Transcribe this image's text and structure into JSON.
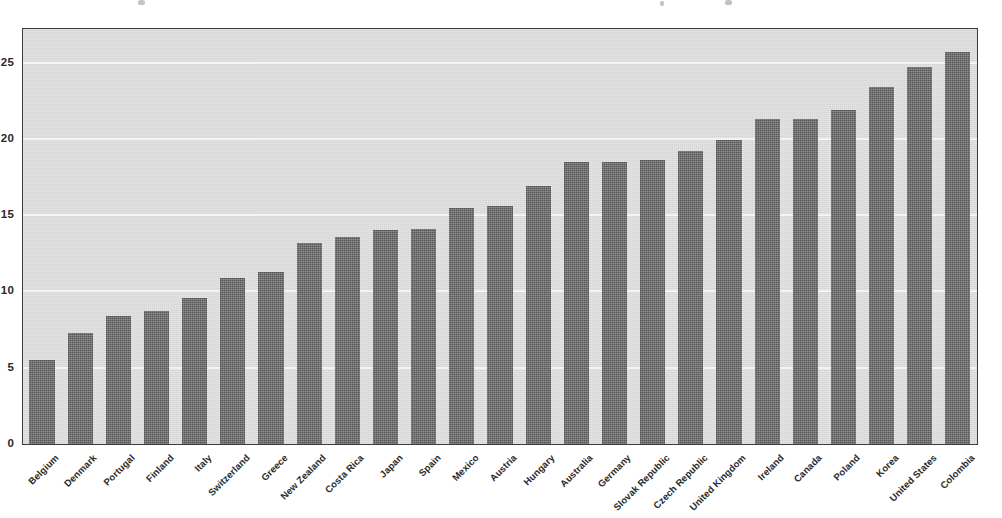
{
  "figure": {
    "ghost_title": "",
    "background_color": "#ffffff",
    "plot_background_color": "#d7d7d7",
    "bar_color": "#565656",
    "gridline_color": "#f2f2f2",
    "frame_color": "#3b3b3b"
  },
  "chart_data": {
    "type": "bar",
    "title": "",
    "xlabel": "",
    "ylabel": "",
    "ylim": [
      0,
      27.2
    ],
    "yticks": [
      0,
      5,
      10,
      15,
      20,
      25
    ],
    "grid": true,
    "legend": null,
    "orientation": "vertical",
    "sorted": "ascending",
    "categories": [
      "Belgium",
      "Denmark",
      "Portugal",
      "Finland",
      "Italy",
      "Switzerland",
      "Greece",
      "New Zealand",
      "Costa Rica",
      "Japan",
      "Spain",
      "Mexico",
      "Austria",
      "Hungary",
      "Australia",
      "Germany",
      "Slovak Republic",
      "Czech Republic",
      "United Kingdom",
      "Ireland",
      "Canada",
      "Poland",
      "Korea",
      "United States",
      "Colombia"
    ],
    "values": [
      5.5,
      7.3,
      8.4,
      8.7,
      9.6,
      10.9,
      11.3,
      13.2,
      13.6,
      14.0,
      14.1,
      15.5,
      15.6,
      16.9,
      18.5,
      18.5,
      18.6,
      19.2,
      19.9,
      21.3,
      21.3,
      21.9,
      23.4,
      24.7,
      25.7
    ]
  }
}
